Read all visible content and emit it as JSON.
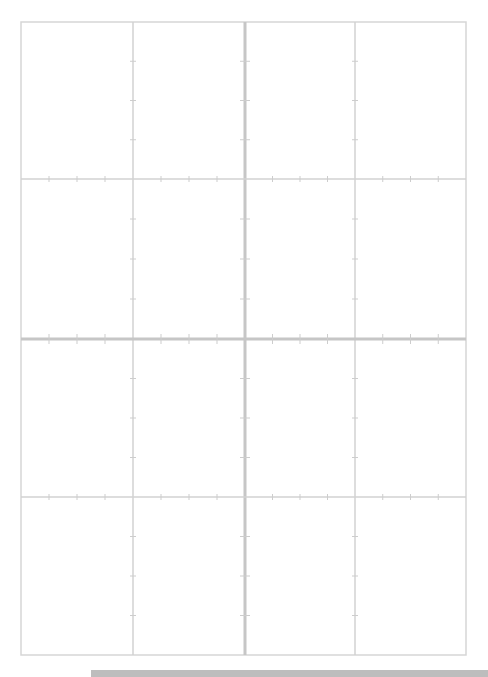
{
  "page": {
    "type": "layout-grid-sheet",
    "width": 488,
    "height": 677,
    "background": "#ffffff"
  },
  "grid": {
    "frame": {
      "left": 21,
      "top": 22,
      "right": 466,
      "bottom": 655,
      "color": "#d6d6d6",
      "stroke": 1.5
    },
    "columns": [
      {
        "x": 133,
        "weight": "thin"
      },
      {
        "x": 245,
        "weight": "thick"
      },
      {
        "x": 355,
        "weight": "thin"
      }
    ],
    "rows": [
      {
        "y": 179,
        "weight": "thin"
      },
      {
        "y": 339,
        "weight": "thick"
      },
      {
        "y": 497,
        "weight": "thin"
      }
    ],
    "thin_color": "#d2d2d2",
    "thick_color": "#c6c6c6",
    "thin_stroke": 1.5,
    "thick_stroke": 3,
    "tick_color": "#cdcdcd",
    "ticks_per_cell": 3
  },
  "footer_bar": {
    "color": "#bdbdbd",
    "left": 91,
    "top": 670,
    "height": 7
  },
  "corner_label": ""
}
